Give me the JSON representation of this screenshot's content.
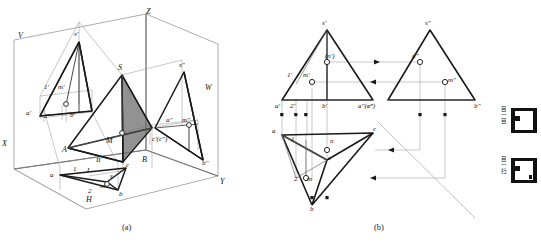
{
  "figure": {
    "captions": {
      "a": "(a)",
      "b": "(b)"
    }
  },
  "part_a": {
    "name": "pictorial-projection-box",
    "axes": {
      "x": "X",
      "y": "Y",
      "z": "Z"
    },
    "planes": {
      "v": "V",
      "h": "H",
      "w": "W"
    },
    "labels_v_plane": [
      "s'",
      "1'",
      "m'",
      "a'",
      "2'",
      "b'"
    ],
    "labels_solid": [
      "S",
      "M",
      "A",
      "B",
      "I",
      "II",
      "c'(c\")"
    ],
    "labels_w_plane": [
      "s\"",
      "a\"",
      "m\"",
      "b\""
    ],
    "labels_h_plane": [
      "a",
      "1",
      "II",
      "2",
      "m",
      "s",
      "b",
      "c"
    ],
    "shaded_face": "SBC"
  },
  "part_b": {
    "name": "three-view-orthographic",
    "front_view": {
      "title": "front-view",
      "labels": [
        "s'",
        "1'",
        "m'",
        "(n')",
        "a'",
        "2'",
        "b'",
        "c'"
      ]
    },
    "side_view": {
      "title": "side-view",
      "labels": [
        "s\"",
        "n\"",
        "m\"",
        "a\"(c\")",
        "b\""
      ]
    },
    "top_view": {
      "title": "top-view",
      "labels": [
        "a",
        "1",
        "n",
        "c",
        "s",
        "m",
        "2",
        "b"
      ]
    },
    "miter_line": "45-degree"
  },
  "icons": [
    {
      "name": "thumbnail-top",
      "glyphs": [
        "目",
        "一",
        "目"
      ]
    },
    {
      "name": "thumbnail-bottom",
      "glyphs": [
        "目",
        "一",
        "扫"
      ]
    }
  ],
  "colors": {
    "line": "#1a1a1a",
    "thin": "#8a8a8a",
    "shade": "#6e6e6e",
    "icon": "#111111"
  }
}
